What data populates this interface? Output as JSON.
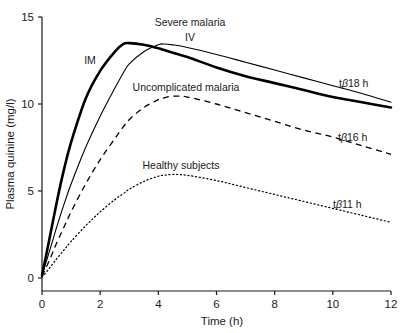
{
  "figure": {
    "background_color": "#ffffff",
    "line_color": "#000000"
  },
  "axes": {
    "x": {
      "title": "Time (h)",
      "ticks": [
        0,
        2,
        4,
        6,
        8,
        10,
        12
      ],
      "tick_labels": [
        "0",
        "2",
        "4",
        "6",
        "8",
        "10",
        "12"
      ],
      "range": [
        0,
        12
      ]
    },
    "y": {
      "title": "Plasma quinine (mg/l)",
      "ticks": [
        0,
        5,
        10,
        15
      ],
      "tick_labels": [
        "0",
        "5",
        "10",
        "15"
      ],
      "range": [
        0,
        15
      ]
    }
  },
  "annotations": {
    "severe_malaria": "Severe malaria",
    "im": "IM",
    "iv": "IV",
    "uncomplicated_malaria": "Uncomplicated malaria",
    "healthy_subjects": "Healthy subjects",
    "half_life_18": {
      "prefix": "t",
      "beta": "β",
      "value": "18 h"
    },
    "half_life_16": {
      "prefix": "t",
      "beta": "β",
      "value": "16 h"
    },
    "half_life_11": {
      "prefix": "t",
      "beta": "β",
      "value": "11 h"
    }
  },
  "chart_data": {
    "type": "line",
    "title": "",
    "xlabel": "Time (h)",
    "ylabel": "Plasma quinine (mg/l)",
    "xlim": [
      0,
      12
    ],
    "ylim": [
      0,
      15
    ],
    "grid": false,
    "legend": "inline-annotations",
    "x": [
      0,
      0.25,
      0.5,
      0.75,
      1,
      1.5,
      2,
      2.5,
      2.8,
      3,
      3.5,
      4,
      4.2,
      4.5,
      5,
      6,
      7,
      8,
      9,
      10,
      11,
      12
    ],
    "series": [
      {
        "name": "Severe malaria IM",
        "label": "IM",
        "group": "Severe malaria",
        "style": "solid-thick",
        "linewidth": 2.6,
        "half_life_h": 18,
        "peak_time_h": 2.8,
        "peak_value": 13.5,
        "values": [
          0.15,
          2.2,
          4.3,
          6.2,
          7.8,
          10.3,
          11.9,
          13.0,
          13.45,
          13.5,
          13.4,
          13.2,
          13.1,
          12.95,
          12.7,
          12.1,
          11.6,
          11.2,
          10.8,
          10.4,
          10.1,
          9.8
        ]
      },
      {
        "name": "Severe malaria IV",
        "label": "IV",
        "group": "Severe malaria",
        "style": "solid-thin",
        "linewidth": 1.1,
        "half_life_h": 18,
        "peak_time_h": 4.2,
        "peak_value": 13.45,
        "values": [
          0.15,
          1.5,
          2.9,
          4.2,
          5.4,
          7.5,
          9.3,
          10.9,
          11.8,
          12.3,
          13.0,
          13.4,
          13.45,
          13.4,
          13.25,
          12.85,
          12.4,
          11.95,
          11.5,
          11.05,
          10.6,
          10.1
        ]
      },
      {
        "name": "Uncomplicated malaria",
        "label": "Uncomplicated malaria",
        "group": "Uncomplicated malaria",
        "style": "dashed",
        "linewidth": 1.3,
        "half_life_h": 16,
        "peak_time_h": 4.7,
        "peak_value": 10.45,
        "values": [
          0.1,
          1.0,
          2.0,
          2.9,
          3.8,
          5.4,
          6.8,
          8.0,
          8.7,
          9.1,
          9.8,
          10.25,
          10.35,
          10.45,
          10.4,
          10.0,
          9.5,
          9.0,
          8.5,
          8.1,
          7.6,
          7.1
        ]
      },
      {
        "name": "Healthy subjects",
        "label": "Healthy subjects",
        "group": "Healthy subjects",
        "style": "dotted",
        "linewidth": 1.2,
        "half_life_h": 11,
        "peak_time_h": 4.7,
        "peak_value": 5.95,
        "values": [
          0.05,
          0.55,
          1.1,
          1.6,
          2.1,
          3.0,
          3.8,
          4.5,
          4.85,
          5.1,
          5.55,
          5.85,
          5.9,
          5.95,
          5.9,
          5.6,
          5.2,
          4.8,
          4.4,
          4.0,
          3.6,
          3.2
        ]
      }
    ],
    "annotations": [
      {
        "text": "Severe malaria",
        "x_h": 4.1,
        "y_value": 14.6
      },
      {
        "text": "IM",
        "x_h": 1.7,
        "y_value": 12.5
      },
      {
        "text": "IV",
        "x_h": 5.2,
        "y_value": 13.95
      },
      {
        "text": "Uncomplicated malaria",
        "x_h": 5.5,
        "y_value": 11.2
      },
      {
        "text": "Healthy subjects",
        "x_h": 5.3,
        "y_value": 6.7
      },
      {
        "text": "tβ18 h",
        "x_h": 11.2,
        "y_value": 11.3
      },
      {
        "text": "tβ16 h",
        "x_h": 11.2,
        "y_value": 8.2
      },
      {
        "text": "tβ11 h",
        "x_h": 10.8,
        "y_value": 4.35
      }
    ]
  }
}
